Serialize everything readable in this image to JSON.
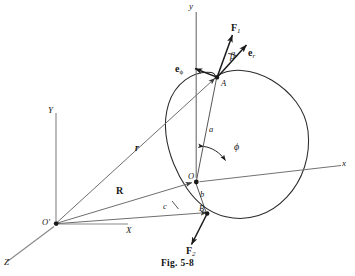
{
  "figure": {
    "caption": "Fig. 5-8",
    "colors": {
      "ink": "#171717",
      "line": "#6b6b6b",
      "body_outline": "#2a2a2a",
      "background": "#ffffff"
    }
  },
  "axes": {
    "body_frame": {
      "origin_label": "O",
      "x_label": "x",
      "y_label": "y"
    },
    "inertial_frame": {
      "origin_label": "O'",
      "x_label": "X",
      "y_label": "Y",
      "z_label": "Z"
    }
  },
  "points": {
    "a_point": "A",
    "b_point": "B"
  },
  "distances": {
    "a": "a",
    "b": "b",
    "c": "c"
  },
  "vectors": {
    "r": "r",
    "R": "R",
    "e_r": "e",
    "e_r_sub": "r",
    "e_phi": "e",
    "e_phi_sub": "ϕ"
  },
  "forces": {
    "f1": "F",
    "f1_sub": "1",
    "f2": "F",
    "f2_sub": "2"
  },
  "angles": {
    "beta": "β",
    "phi": "ϕ"
  }
}
